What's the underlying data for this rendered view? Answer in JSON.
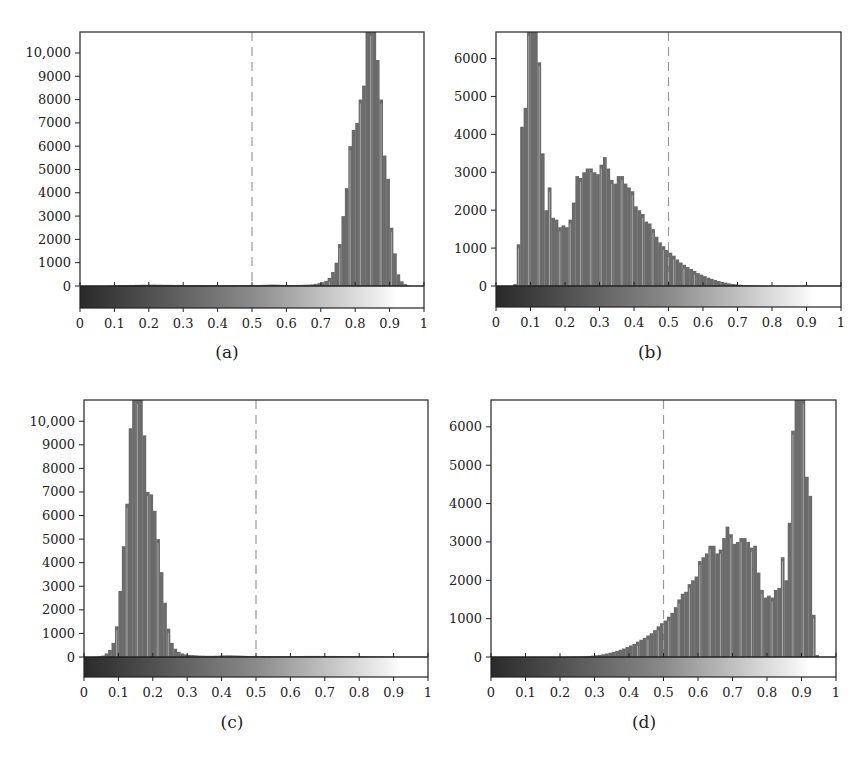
{
  "figure": {
    "threshold": 0.5,
    "colors": {
      "bar": "#6b6b6b",
      "axis": "#222222",
      "dashed": "#9a9a9a",
      "background": "#ffffff"
    }
  },
  "panels": [
    {
      "id": "a",
      "caption": "(a)"
    },
    {
      "id": "b",
      "caption": "(b)"
    },
    {
      "id": "c",
      "caption": "(c)"
    },
    {
      "id": "d",
      "caption": "(d)"
    }
  ],
  "chart_data": [
    {
      "type": "bar",
      "title": "(a)",
      "xlabel": "",
      "ylabel": "",
      "xlim": [
        0,
        1
      ],
      "ylim": [
        0,
        10900
      ],
      "x_ticks": [
        "0",
        "0.1",
        "0.2",
        "0.3",
        "0.4",
        "0.5",
        "0.6",
        "0.7",
        "0.8",
        "0.9",
        "1"
      ],
      "y_ticks": [
        "0",
        "1000",
        "2000",
        "3000",
        "4000",
        "5000",
        "6000",
        "7000",
        "8000",
        "9000",
        "10,000"
      ],
      "y_tick_values": [
        0,
        1000,
        2000,
        3000,
        4000,
        5000,
        6000,
        7000,
        8000,
        9000,
        10000
      ],
      "annotations": [
        "dashed vertical line at x=0.5",
        "grayscale colorbar from 0 (black) to 1 (white) beneath axis"
      ],
      "grid": false,
      "bin_width": 0.01,
      "values": [
        0,
        0,
        0,
        0,
        0,
        0,
        0,
        0,
        10,
        20,
        30,
        35,
        40,
        40,
        45,
        45,
        50,
        50,
        55,
        55,
        60,
        60,
        55,
        55,
        50,
        50,
        50,
        45,
        45,
        45,
        40,
        40,
        40,
        40,
        40,
        40,
        40,
        35,
        35,
        35,
        35,
        35,
        35,
        35,
        35,
        35,
        35,
        40,
        40,
        40,
        40,
        40,
        45,
        50,
        55,
        60,
        60,
        55,
        50,
        45,
        40,
        40,
        40,
        45,
        50,
        55,
        60,
        70,
        90,
        120,
        160,
        220,
        350,
        600,
        1000,
        1800,
        3000,
        4200,
        6000,
        6700,
        7000,
        8000,
        8600,
        11000,
        11000,
        11000,
        9700,
        8000,
        5600,
        4600,
        2500,
        1400,
        500,
        200,
        80,
        20,
        0,
        0,
        0,
        0
      ]
    },
    {
      "type": "bar",
      "title": "(b)",
      "xlabel": "",
      "ylabel": "",
      "xlim": [
        0,
        1
      ],
      "ylim": [
        0,
        6700
      ],
      "x_ticks": [
        "0",
        "0.1",
        "0.2",
        "0.3",
        "0.4",
        "0.5",
        "0.6",
        "0.7",
        "0.8",
        "0.9",
        "1"
      ],
      "y_ticks": [
        "0",
        "1000",
        "2000",
        "3000",
        "4000",
        "5000",
        "6000"
      ],
      "y_tick_values": [
        0,
        1000,
        2000,
        3000,
        4000,
        5000,
        6000
      ],
      "annotations": [
        "dashed vertical line at x=0.5",
        "grayscale colorbar from 0 (black) to 1 (white) beneath axis"
      ],
      "grid": false,
      "bin_width": 0.01,
      "values": [
        0,
        0,
        0,
        0,
        0,
        50,
        1100,
        4200,
        4700,
        7000,
        7000,
        7000,
        5900,
        3500,
        2000,
        2600,
        1800,
        1750,
        1550,
        1600,
        1550,
        1750,
        2200,
        2900,
        2850,
        3000,
        3100,
        3100,
        3000,
        2950,
        3200,
        3400,
        3100,
        2800,
        2700,
        2900,
        2900,
        2700,
        2600,
        2500,
        2100,
        2000,
        1900,
        1700,
        1650,
        1500,
        1300,
        1150,
        1050,
        950,
        880,
        800,
        700,
        620,
        560,
        500,
        450,
        400,
        340,
        300,
        260,
        220,
        190,
        160,
        130,
        110,
        90,
        70,
        55,
        45,
        35,
        28,
        20,
        15,
        12,
        10,
        8,
        6,
        4,
        3,
        2,
        2,
        1,
        1,
        0,
        0,
        0,
        0,
        0,
        0,
        0,
        0,
        0,
        0,
        0,
        0,
        0,
        0,
        0,
        0
      ]
    },
    {
      "type": "bar",
      "title": "(c)",
      "xlabel": "",
      "ylabel": "",
      "xlim": [
        0,
        1
      ],
      "ylim": [
        0,
        10900
      ],
      "x_ticks": [
        "0",
        "0.1",
        "0.2",
        "0.3",
        "0.4",
        "0.5",
        "0.6",
        "0.7",
        "0.8",
        "0.9",
        "1"
      ],
      "y_ticks": [
        "0",
        "1000",
        "2000",
        "3000",
        "4000",
        "5000",
        "6000",
        "7000",
        "8000",
        "9000",
        "10,000"
      ],
      "y_tick_values": [
        0,
        1000,
        2000,
        3000,
        4000,
        5000,
        6000,
        7000,
        8000,
        9000,
        10000
      ],
      "annotations": [
        "dashed vertical line at x=0.5",
        "grayscale colorbar from 0 (black) to 1 (white) beneath axis"
      ],
      "grid": false,
      "bin_width": 0.01,
      "values": [
        0,
        0,
        0,
        10,
        30,
        60,
        150,
        300,
        600,
        1300,
        2800,
        4700,
        6500,
        9700,
        11000,
        11000,
        11000,
        9400,
        7000,
        6900,
        6200,
        5000,
        3600,
        2300,
        1200,
        600,
        350,
        220,
        150,
        110,
        90,
        80,
        70,
        60,
        55,
        50,
        50,
        50,
        55,
        60,
        65,
        70,
        70,
        65,
        60,
        55,
        50,
        45,
        40,
        40,
        40,
        40,
        40,
        40,
        35,
        35,
        35,
        35,
        35,
        40,
        40,
        40,
        40,
        40,
        45,
        45,
        45,
        45,
        45,
        45,
        45,
        45,
        45,
        40,
        40,
        40,
        40,
        40,
        40,
        35,
        35,
        30,
        30,
        25,
        25,
        20,
        20,
        15,
        15,
        10,
        5,
        0,
        0,
        0,
        0,
        0,
        0,
        0,
        0,
        0
      ]
    },
    {
      "type": "bar",
      "title": "(d)",
      "xlabel": "",
      "ylabel": "",
      "xlim": [
        0,
        1
      ],
      "ylim": [
        0,
        6700
      ],
      "x_ticks": [
        "0",
        "0.1",
        "0.2",
        "0.3",
        "0.4",
        "0.5",
        "0.6",
        "0.7",
        "0.8",
        "0.9",
        "1"
      ],
      "y_ticks": [
        "0",
        "1000",
        "2000",
        "3000",
        "4000",
        "5000",
        "6000"
      ],
      "y_tick_values": [
        0,
        1000,
        2000,
        3000,
        4000,
        5000,
        6000
      ],
      "annotations": [
        "dashed vertical line at x=0.5",
        "grayscale colorbar from 0 (black) to 1 (white) beneath axis"
      ],
      "grid": false,
      "bin_width": 0.01,
      "values": [
        0,
        0,
        0,
        0,
        0,
        0,
        0,
        0,
        0,
        0,
        0,
        0,
        0,
        0,
        0,
        0,
        1,
        1,
        2,
        2,
        3,
        4,
        6,
        8,
        10,
        12,
        15,
        20,
        28,
        35,
        45,
        55,
        70,
        90,
        110,
        130,
        160,
        190,
        220,
        260,
        300,
        340,
        400,
        450,
        500,
        560,
        620,
        700,
        800,
        880,
        950,
        1050,
        1150,
        1300,
        1500,
        1650,
        1700,
        1900,
        2000,
        2100,
        2500,
        2600,
        2700,
        2900,
        2900,
        2700,
        2800,
        3100,
        3400,
        3200,
        2950,
        3000,
        3100,
        3100,
        3000,
        2850,
        2900,
        2200,
        1750,
        1550,
        1600,
        1550,
        1750,
        1800,
        2600,
        2000,
        3500,
        5900,
        7000,
        7000,
        7000,
        4700,
        4200,
        1100,
        50,
        0,
        0,
        0,
        0,
        0
      ]
    }
  ]
}
